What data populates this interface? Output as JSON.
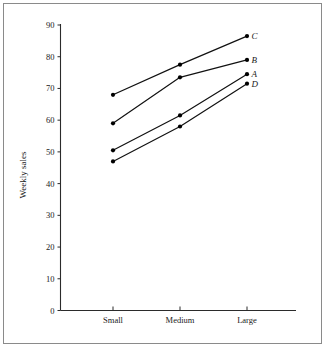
{
  "chart_data": {
    "type": "line",
    "title": "",
    "xlabel": "",
    "ylabel": "Weekly sales",
    "categories": [
      "Small",
      "Medium",
      "Large"
    ],
    "ylim": [
      0,
      90
    ],
    "yticks": [
      0,
      10,
      20,
      30,
      40,
      50,
      60,
      70,
      80,
      90
    ],
    "ytick_labels": [
      "0",
      "10",
      "20",
      "30",
      "40",
      "50",
      "60",
      "70",
      "80",
      "90"
    ],
    "grid": false,
    "legend_position": "right-end-labels",
    "marker": "filled-circle",
    "line_color": "#111111",
    "series": [
      {
        "name": "A",
        "values": [
          50.5,
          61.5,
          74.5
        ]
      },
      {
        "name": "B",
        "values": [
          59,
          73.5,
          79
        ]
      },
      {
        "name": "C",
        "values": [
          68,
          77.5,
          86.5
        ]
      },
      {
        "name": "D",
        "values": [
          47,
          58,
          71.5
        ]
      }
    ]
  }
}
